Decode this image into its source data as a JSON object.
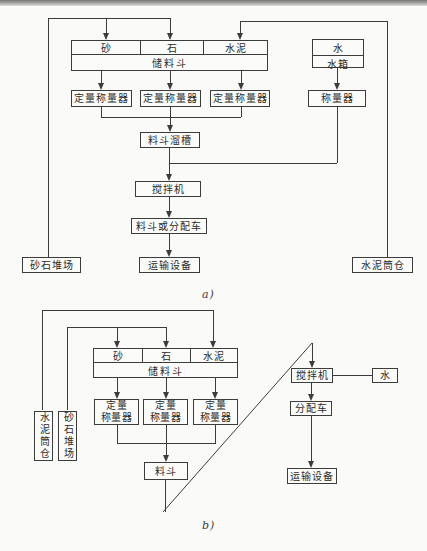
{
  "diagram_a": {
    "caption": "a)",
    "nodes": {
      "sand": "砂",
      "stone": "石",
      "cement": "水泥",
      "storage_hopper": "储料斗",
      "water": "水",
      "water_tank": "水箱",
      "dosing_weigher": "定量称量器",
      "water_weigher": "称量器",
      "hopper_chute": "料斗溜槽",
      "mixer": "搅拌机",
      "hopper_or_distribution_cart": "料斗或分配车",
      "transport_equipment": "运输设备",
      "aggregate_yard": "砂石堆场",
      "cement_silo": "水泥筒仓"
    }
  },
  "diagram_b": {
    "caption": "b)",
    "nodes": {
      "sand": "砂",
      "stone": "石",
      "cement": "水泥",
      "storage_hopper": "储料斗",
      "dosing_weigher_line1": "定量",
      "dosing_weigher_line2": "称量器",
      "hopper": "料斗",
      "cement_silo": "水泥筒仓",
      "aggregate_yard": "砂石堆场",
      "mixer": "搅拌机",
      "water": "水",
      "distribution_cart": "分配车",
      "transport_equipment": "运输设备"
    }
  }
}
